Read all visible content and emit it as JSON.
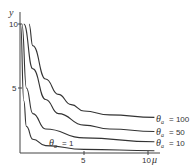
{
  "chart_data": {
    "type": "line",
    "title": "",
    "xlabel": "μ",
    "ylabel": "y",
    "xlim": [
      0,
      11
    ],
    "ylim": [
      0,
      10.5
    ],
    "x_ticks": [
      "5",
      "10"
    ],
    "y_ticks": [
      "5",
      "10"
    ],
    "grid": false,
    "series": [
      {
        "name": "θa = 100",
        "label_text": "= 100",
        "x": [
          0.7,
          1,
          2,
          3,
          4,
          5,
          7,
          10.5
        ],
        "values": [
          10,
          8.3,
          5.7,
          4.5,
          3.7,
          3.2,
          2.9,
          2.7
        ]
      },
      {
        "name": "θa = 50",
        "label_text": "= 50",
        "x": [
          0.3,
          1,
          2,
          3,
          5,
          7,
          10.5
        ],
        "values": [
          10,
          6.5,
          4.1,
          3.0,
          2.1,
          1.8,
          1.6
        ]
      },
      {
        "name": "θa = 10",
        "label_text": "= 10",
        "x": [
          0.15,
          0.5,
          1,
          2,
          5,
          10.5
        ],
        "values": [
          10,
          5,
          3,
          1.8,
          1.1,
          0.8
        ]
      },
      {
        "name": "θa = 1",
        "label_text": "= 1",
        "x": [
          0.05,
          0.3,
          0.5,
          1,
          2,
          5,
          10.5
        ],
        "values": [
          10,
          4,
          2,
          1,
          0.5,
          0.2,
          0.1
        ]
      }
    ]
  },
  "labels": {
    "theta": "θ",
    "sub": "a"
  }
}
